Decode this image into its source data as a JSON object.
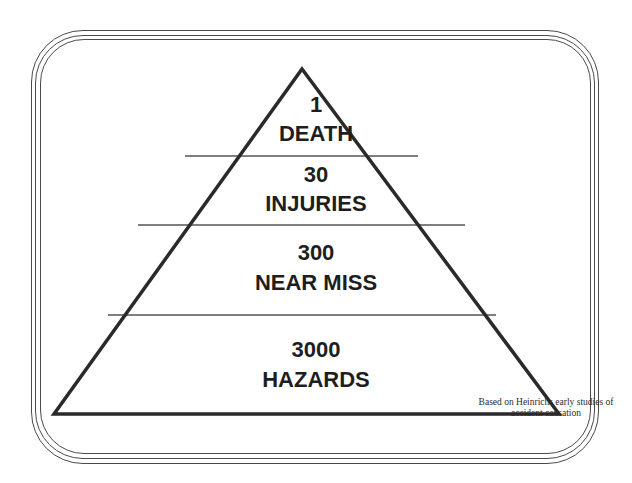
{
  "diagram": {
    "type": "pyramid",
    "levels": [
      {
        "count": "1",
        "label": "DEATH"
      },
      {
        "count": "30",
        "label": "INJURIES"
      },
      {
        "count": "300",
        "label": "NEAR MISS"
      },
      {
        "count": "3000",
        "label": "HAZARDS"
      }
    ],
    "footnote": {
      "line1": "Based on Heinrichs early studies of",
      "line2": "accident causation"
    },
    "colors": {
      "outline": "#2a2a2a",
      "divider": "#555555",
      "text": "#1e1e1e",
      "background": "#ffffff"
    }
  }
}
